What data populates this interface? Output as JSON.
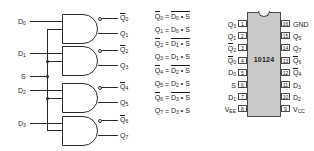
{
  "diagram": {
    "schematic": {
      "inputs": [
        {
          "name": "D0",
          "base": "D",
          "sub": "0"
        },
        {
          "name": "D1",
          "base": "D",
          "sub": "1"
        },
        {
          "name": "S",
          "base": "S",
          "sub": ""
        },
        {
          "name": "D2",
          "base": "D",
          "sub": "2"
        },
        {
          "name": "D3",
          "base": "D",
          "sub": "3"
        }
      ],
      "gates": [
        {
          "id": "gate-0",
          "out_inverted": {
            "base": "Q",
            "sub": "0"
          },
          "out_true": {
            "base": "Q",
            "sub": "1"
          }
        },
        {
          "id": "gate-1",
          "out_inverted": {
            "base": "Q",
            "sub": "2"
          },
          "out_true": {
            "base": "Q",
            "sub": "3"
          }
        },
        {
          "id": "gate-2",
          "out_inverted": {
            "base": "Q",
            "sub": "4"
          },
          "out_true": {
            "base": "Q",
            "sub": "5"
          }
        },
        {
          "id": "gate-3",
          "out_inverted": {
            "base": "Q",
            "sub": "6"
          },
          "out_true": {
            "base": "Q",
            "sub": "7"
          }
        }
      ]
    },
    "equations": [
      {
        "lhs_base": "Q",
        "lhs_sub": "0",
        "lhs_bar": true,
        "rhs_base": "D",
        "rhs_sub": "0",
        "rhs_bar": true,
        "op": "•",
        "operand": "S"
      },
      {
        "lhs_base": "Q",
        "lhs_sub": "1",
        "lhs_bar": false,
        "rhs_base": "D",
        "rhs_sub": "0",
        "rhs_bar": false,
        "op": "•",
        "operand": "S"
      },
      {
        "lhs_base": "Q",
        "lhs_sub": "2",
        "lhs_bar": true,
        "rhs_base": "D",
        "rhs_sub": "1",
        "rhs_bar": true,
        "op": "•",
        "operand": "S"
      },
      {
        "lhs_base": "Q",
        "lhs_sub": "3",
        "lhs_bar": false,
        "rhs_base": "D",
        "rhs_sub": "1",
        "rhs_bar": false,
        "op": "•",
        "operand": "S"
      },
      {
        "lhs_base": "Q",
        "lhs_sub": "4",
        "lhs_bar": true,
        "rhs_base": "D",
        "rhs_sub": "2",
        "rhs_bar": true,
        "op": "•",
        "operand": "S"
      },
      {
        "lhs_base": "Q",
        "lhs_sub": "5",
        "lhs_bar": false,
        "rhs_base": "D",
        "rhs_sub": "2",
        "rhs_bar": false,
        "op": "•",
        "operand": "S"
      },
      {
        "lhs_base": "Q",
        "lhs_sub": "6",
        "lhs_bar": true,
        "rhs_base": "D",
        "rhs_sub": "3",
        "rhs_bar": true,
        "op": "•",
        "operand": "S"
      },
      {
        "lhs_base": "Q",
        "lhs_sub": "7",
        "lhs_bar": false,
        "rhs_base": "D",
        "rhs_sub": "3",
        "rhs_bar": false,
        "op": "•",
        "operand": "S"
      }
    ],
    "pinout": {
      "part_number": "10124",
      "left_pins": [
        {
          "number": "1",
          "base": "Q",
          "sub": "3",
          "bar": false
        },
        {
          "number": "2",
          "base": "Q",
          "sub": "1",
          "bar": false
        },
        {
          "number": "3",
          "base": "Q",
          "sub": "2",
          "bar": true
        },
        {
          "number": "4",
          "base": "Q",
          "sub": "0",
          "bar": true
        },
        {
          "number": "5",
          "base": "D",
          "sub": "0",
          "bar": false
        },
        {
          "number": "6",
          "base": "S",
          "sub": "",
          "bar": false
        },
        {
          "number": "7",
          "base": "D",
          "sub": "1",
          "bar": false
        },
        {
          "number": "8",
          "base": "V",
          "sub": "EE",
          "bar": false
        }
      ],
      "right_pins": [
        {
          "number": "16",
          "base": "GND",
          "sub": "",
          "bar": false
        },
        {
          "number": "15",
          "base": "Q",
          "sub": "5",
          "bar": false
        },
        {
          "number": "14",
          "base": "Q",
          "sub": "7",
          "bar": false
        },
        {
          "number": "13",
          "base": "Q",
          "sub": "6",
          "bar": true
        },
        {
          "number": "12",
          "base": "Q",
          "sub": "4",
          "bar": true
        },
        {
          "number": "11",
          "base": "D",
          "sub": "3",
          "bar": false
        },
        {
          "number": "10",
          "base": "D",
          "sub": "2",
          "bar": false
        },
        {
          "number": "9",
          "base": "V",
          "sub": "CC",
          "bar": false
        }
      ]
    },
    "colors": {
      "wire": "#2b2b2b",
      "ic_body": "#c9c9c9",
      "ic_outline": "#4a4a4a",
      "text": "#1a1a1a",
      "background": "#ffffff"
    }
  }
}
